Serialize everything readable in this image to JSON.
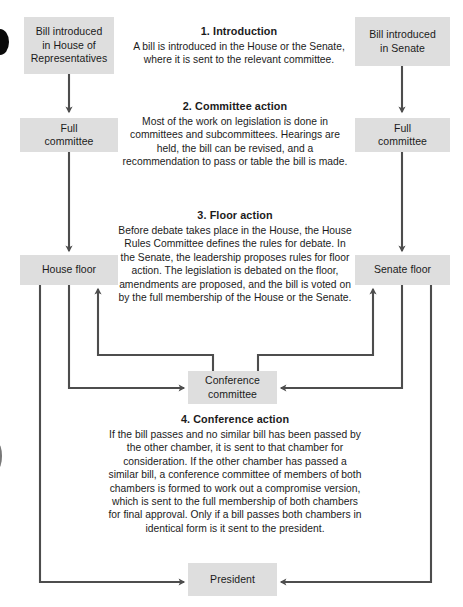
{
  "diagram": {
    "line_color": "#4d4d4d",
    "box_fill": "#dedede",
    "text_color": "#1b1b1b"
  },
  "nodes": {
    "house_intro": {
      "label": "Bill introduced\nin House of\nRepresentatives"
    },
    "senate_intro": {
      "label": "Bill introduced\nin Senate"
    },
    "house_committee": {
      "label": "Full\ncommittee"
    },
    "senate_committee": {
      "label": "Full\ncommittee"
    },
    "house_floor": {
      "label": "House floor"
    },
    "senate_floor": {
      "label": "Senate floor"
    },
    "conference_committee": {
      "label": "Conference\ncommittee"
    },
    "president": {
      "label": "President"
    }
  },
  "steps": [
    {
      "number": "1.",
      "title": "1.  Introduction",
      "body": "A bill is introduced in the House or the Senate, where it is sent to the relevant committee."
    },
    {
      "number": "2.",
      "title": "2.  Committee action",
      "body": "Most of the work on legislation is done in committees and subcommittees. Hearings are held, the bill can be revised, and a recommendation to pass or table the bill is made."
    },
    {
      "number": "3.",
      "title": "3.  Floor action",
      "body": "Before debate takes place in the House, the House Rules Committee defines the rules for debate. In the Senate, the leadership proposes rules for floor action. The legislation is debated on the floor, amendments are proposed, and the bill is voted on by the full membership of the House or the Senate."
    },
    {
      "number": "4.",
      "title": "4.  Conference action",
      "body": "If the bill passes and no similar bill has been passed by the other chamber, it is sent to that chamber for consideration. If the other chamber has passed a similar bill, a conference committee of members of both chambers is formed to work out a compromise version, which is sent to the full membership of both chambers for final approval. Only if a bill passes both chambers in identical form is it sent to the president."
    }
  ]
}
